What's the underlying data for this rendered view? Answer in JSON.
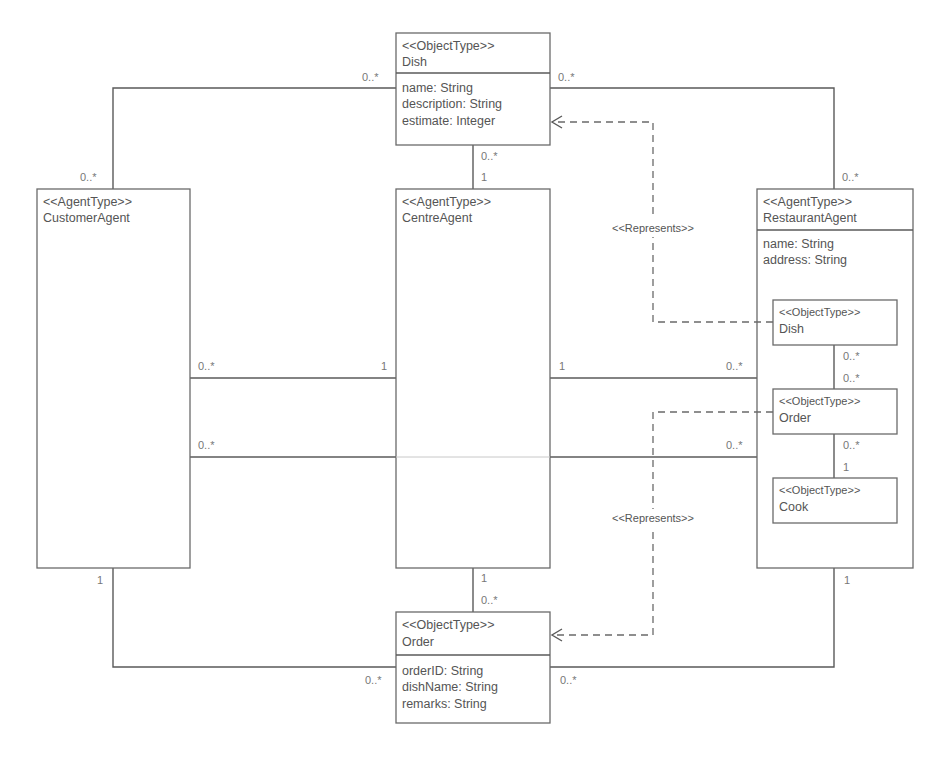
{
  "diagram": {
    "type": "uml-agent-class-diagram",
    "classes": {
      "dish": {
        "stereotype": "<<ObjectType>>",
        "name": "Dish",
        "attributes": [
          "name: String",
          "description: String",
          "estimate: Integer"
        ]
      },
      "customer_agent": {
        "stereotype": "<<AgentType>>",
        "name": "CustomerAgent",
        "attributes": []
      },
      "centre_agent": {
        "stereotype": "<<AgentType>>",
        "name": "CentreAgent",
        "attributes": []
      },
      "restaurant_agent": {
        "stereotype": "<<AgentType>>",
        "name": "RestaurantAgent",
        "attributes": [
          "name: String",
          "address: String"
        ],
        "inner": {
          "dish": {
            "stereotype": "<<ObjectType>>",
            "name": "Dish"
          },
          "order": {
            "stereotype": "<<ObjectType>>",
            "name": "Order"
          },
          "cook": {
            "stereotype": "<<ObjectType>>",
            "name": "Cook"
          }
        }
      },
      "order": {
        "stereotype": "<<ObjectType>>",
        "name": "Order",
        "attributes": [
          "orderID: String",
          "dishName: String",
          "remarks: String"
        ]
      }
    },
    "associations": {
      "dish_customer": {
        "dish_end": "0..*",
        "customer_end": "0..*"
      },
      "dish_restaurant": {
        "dish_end": "0..*",
        "restaurant_end": "0..*"
      },
      "dish_centre": {
        "dish_end": "0..*",
        "centre_end": "1"
      },
      "customer_centre": {
        "customer_end": "0..*",
        "centre_end": "1"
      },
      "centre_restaurant": {
        "centre_end": "1",
        "restaurant_end": "0..*"
      },
      "customer_restaurant": {
        "customer_end": "0..*",
        "restaurant_end": "0..*"
      },
      "centre_order": {
        "centre_end": "1",
        "order_end": "0..*"
      },
      "customer_order": {
        "customer_end": "1",
        "order_end": "0..*"
      },
      "restaurant_order": {
        "restaurant_end": "1",
        "order_end": "0..*"
      },
      "inner_dish_order": {
        "dish_end": "0..*",
        "order_end": "0..*"
      },
      "inner_order_cook": {
        "order_end": "0..*",
        "cook_end": "1"
      }
    },
    "dependencies": {
      "represents_dish": "<<Represents>>",
      "represents_order": "<<Represents>>"
    }
  }
}
